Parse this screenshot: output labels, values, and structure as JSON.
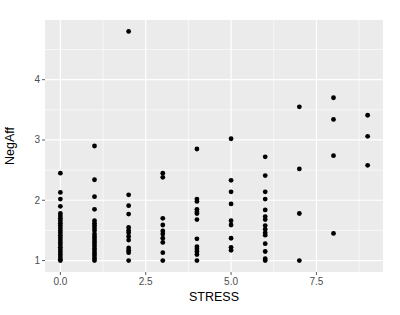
{
  "chart_data": {
    "type": "scatter",
    "title": "",
    "xlabel": "STRESS",
    "ylabel": "NegAff",
    "xlim": [
      -0.45,
      9.45
    ],
    "ylim": [
      0.81,
      4.99
    ],
    "x_ticks": [
      0,
      2.5,
      5,
      7.5
    ],
    "x_tick_labels": [
      "0.0",
      "2.5",
      "5.0",
      "7.5"
    ],
    "y_ticks": [
      1,
      2,
      3,
      4
    ],
    "y_tick_labels": [
      "1",
      "2",
      "3",
      "4"
    ],
    "grid": true,
    "legend": null,
    "style": {
      "panel_background": "#EBEBEB",
      "grid_color": "#FFFFFF",
      "point_color": "#000000"
    },
    "points": [
      {
        "x": 0,
        "y": 2.45
      },
      {
        "x": 0,
        "y": 2.13
      },
      {
        "x": 0,
        "y": 2.02
      },
      {
        "x": 0,
        "y": 1.9
      },
      {
        "x": 0,
        "y": 1.78
      },
      {
        "x": 0,
        "y": 1.74
      },
      {
        "x": 0,
        "y": 1.7
      },
      {
        "x": 0,
        "y": 1.66
      },
      {
        "x": 0,
        "y": 1.62
      },
      {
        "x": 0,
        "y": 1.58
      },
      {
        "x": 0,
        "y": 1.54
      },
      {
        "x": 0,
        "y": 1.5
      },
      {
        "x": 0,
        "y": 1.46
      },
      {
        "x": 0,
        "y": 1.42
      },
      {
        "x": 0,
        "y": 1.38
      },
      {
        "x": 0,
        "y": 1.34
      },
      {
        "x": 0,
        "y": 1.3
      },
      {
        "x": 0,
        "y": 1.26
      },
      {
        "x": 0,
        "y": 1.22
      },
      {
        "x": 0,
        "y": 1.18
      },
      {
        "x": 0,
        "y": 1.14
      },
      {
        "x": 0,
        "y": 1.1
      },
      {
        "x": 0,
        "y": 1.06
      },
      {
        "x": 0,
        "y": 1.02
      },
      {
        "x": 0,
        "y": 1.0
      },
      {
        "x": 1,
        "y": 2.9
      },
      {
        "x": 1,
        "y": 2.34
      },
      {
        "x": 1,
        "y": 2.06
      },
      {
        "x": 1,
        "y": 1.85
      },
      {
        "x": 1,
        "y": 1.66
      },
      {
        "x": 1,
        "y": 1.62
      },
      {
        "x": 1,
        "y": 1.58
      },
      {
        "x": 1,
        "y": 1.54
      },
      {
        "x": 1,
        "y": 1.5
      },
      {
        "x": 1,
        "y": 1.44
      },
      {
        "x": 1,
        "y": 1.4
      },
      {
        "x": 1,
        "y": 1.36
      },
      {
        "x": 1,
        "y": 1.32
      },
      {
        "x": 1,
        "y": 1.28
      },
      {
        "x": 1,
        "y": 1.24
      },
      {
        "x": 1,
        "y": 1.2
      },
      {
        "x": 1,
        "y": 1.16
      },
      {
        "x": 1,
        "y": 1.12
      },
      {
        "x": 1,
        "y": 1.08
      },
      {
        "x": 1,
        "y": 1.04
      },
      {
        "x": 1,
        "y": 1.0
      },
      {
        "x": 2,
        "y": 4.8
      },
      {
        "x": 2,
        "y": 2.09
      },
      {
        "x": 2,
        "y": 1.91
      },
      {
        "x": 2,
        "y": 1.77
      },
      {
        "x": 2,
        "y": 1.55
      },
      {
        "x": 2,
        "y": 1.5
      },
      {
        "x": 2,
        "y": 1.46
      },
      {
        "x": 2,
        "y": 1.4
      },
      {
        "x": 2,
        "y": 1.34
      },
      {
        "x": 2,
        "y": 1.21
      },
      {
        "x": 2,
        "y": 1.17
      },
      {
        "x": 2,
        "y": 1.13
      },
      {
        "x": 2,
        "y": 1.0
      },
      {
        "x": 3,
        "y": 2.45
      },
      {
        "x": 3,
        "y": 2.38
      },
      {
        "x": 3,
        "y": 1.7
      },
      {
        "x": 3,
        "y": 1.59
      },
      {
        "x": 3,
        "y": 1.49
      },
      {
        "x": 3,
        "y": 1.44
      },
      {
        "x": 3,
        "y": 1.37
      },
      {
        "x": 3,
        "y": 1.3
      },
      {
        "x": 3,
        "y": 1.13
      },
      {
        "x": 3,
        "y": 1.0
      },
      {
        "x": 4,
        "y": 2.85
      },
      {
        "x": 4,
        "y": 2.02
      },
      {
        "x": 4,
        "y": 1.98
      },
      {
        "x": 4,
        "y": 1.85
      },
      {
        "x": 4,
        "y": 1.81
      },
      {
        "x": 4,
        "y": 1.78
      },
      {
        "x": 4,
        "y": 1.68
      },
      {
        "x": 4,
        "y": 1.36
      },
      {
        "x": 4,
        "y": 1.23
      },
      {
        "x": 4,
        "y": 1.19
      },
      {
        "x": 4,
        "y": 1.15
      },
      {
        "x": 4,
        "y": 1.1
      },
      {
        "x": 4,
        "y": 1.0
      },
      {
        "x": 5,
        "y": 3.02
      },
      {
        "x": 5,
        "y": 2.33
      },
      {
        "x": 5,
        "y": 2.14
      },
      {
        "x": 5,
        "y": 1.94
      },
      {
        "x": 5,
        "y": 1.66
      },
      {
        "x": 5,
        "y": 1.59
      },
      {
        "x": 5,
        "y": 1.37
      },
      {
        "x": 5,
        "y": 1.22
      },
      {
        "x": 5,
        "y": 1.17
      },
      {
        "x": 6,
        "y": 2.72
      },
      {
        "x": 6,
        "y": 2.41
      },
      {
        "x": 6,
        "y": 2.14
      },
      {
        "x": 6,
        "y": 2.02
      },
      {
        "x": 6,
        "y": 1.84
      },
      {
        "x": 6,
        "y": 1.73
      },
      {
        "x": 6,
        "y": 1.68
      },
      {
        "x": 6,
        "y": 1.58
      },
      {
        "x": 6,
        "y": 1.52
      },
      {
        "x": 6,
        "y": 1.46
      },
      {
        "x": 6,
        "y": 1.42
      },
      {
        "x": 6,
        "y": 1.28
      },
      {
        "x": 6,
        "y": 1.15
      },
      {
        "x": 6,
        "y": 1.03
      },
      {
        "x": 6,
        "y": 1.0
      },
      {
        "x": 7,
        "y": 3.55
      },
      {
        "x": 7,
        "y": 2.52
      },
      {
        "x": 7,
        "y": 1.78
      },
      {
        "x": 7,
        "y": 1.0
      },
      {
        "x": 8,
        "y": 3.7
      },
      {
        "x": 8,
        "y": 3.34
      },
      {
        "x": 8,
        "y": 2.74
      },
      {
        "x": 8,
        "y": 1.45
      },
      {
        "x": 9,
        "y": 3.41
      },
      {
        "x": 9,
        "y": 3.06
      },
      {
        "x": 9,
        "y": 2.58
      }
    ]
  }
}
